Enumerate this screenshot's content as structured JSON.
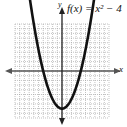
{
  "chart_data": {
    "type": "line",
    "title": "f(x) = x² − 4",
    "function": "x^2 - 4",
    "xlabel": "x",
    "ylabel": "y",
    "xlim": [
      -5,
      5
    ],
    "ylim": [
      -5,
      5
    ],
    "grid": true,
    "series": [
      {
        "name": "f(x) = x^2 - 4",
        "x": [
          -3,
          -2.5,
          -2,
          -1.5,
          -1,
          -0.5,
          0,
          0.5,
          1,
          1.5,
          2,
          2.5,
          3
        ],
        "y": [
          5,
          2.25,
          0,
          -1.75,
          -3,
          -3.75,
          -4,
          -3.75,
          -3,
          -1.75,
          0,
          2.25,
          5
        ]
      }
    ],
    "annotations": [
      "vertex (0, -4)",
      "x-intercepts (-2, 0) and (2, 0)"
    ]
  },
  "labels": {
    "function": "f(x) = x² − 4",
    "x_axis": "x",
    "y_axis": "y"
  },
  "colors": {
    "curve": "#111111",
    "axis": "#555555",
    "grid": "#9a9a9a"
  }
}
